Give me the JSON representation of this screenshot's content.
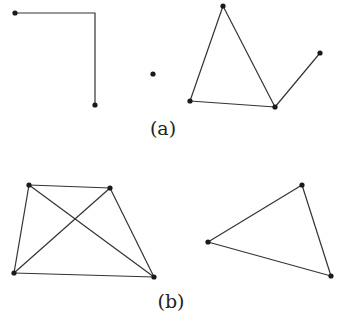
{
  "figure": {
    "width": 341,
    "height": 332,
    "colors": {
      "edge": "#333333",
      "vertex": "#1a1a1a",
      "label": "#222222",
      "background": "#ffffff"
    },
    "panels": [
      {
        "id": "a",
        "label": "(a)",
        "label_pos": [
          163,
          135
        ],
        "components": [
          {
            "name": "path-component",
            "vertices": [
              [
                15,
                13
              ],
              [
                95,
                105
              ]
            ],
            "bend_points": [
              [
                95,
                13
              ]
            ],
            "edges": [
              [
                [
                  15,
                  13
                ],
                [
                  95,
                  13
                ]
              ],
              [
                [
                  95,
                  13
                ],
                [
                  95,
                  105
                ]
              ]
            ]
          },
          {
            "name": "isolated-vertex",
            "vertices": [
              [
                153,
                74
              ]
            ],
            "edges": []
          },
          {
            "name": "triangle-with-pendant",
            "vertices": [
              [
                223,
                6
              ],
              [
                190,
                101
              ],
              [
                275,
                107
              ],
              [
                320,
                53
              ]
            ],
            "edges": [
              [
                0,
                1
              ],
              [
                0,
                2
              ],
              [
                1,
                2
              ],
              [
                2,
                3
              ]
            ]
          }
        ]
      },
      {
        "id": "b",
        "label": "(b)",
        "label_pos": [
          171,
          308
        ],
        "components": [
          {
            "name": "complete-graph-k4",
            "vertices": [
              [
                29,
                185
              ],
              [
                110,
                188
              ],
              [
                14,
                273
              ],
              [
                154,
                277
              ]
            ],
            "edges": [
              [
                0,
                1
              ],
              [
                0,
                2
              ],
              [
                0,
                3
              ],
              [
                1,
                2
              ],
              [
                1,
                3
              ],
              [
                2,
                3
              ]
            ]
          },
          {
            "name": "triangle",
            "vertices": [
              [
                302,
                185
              ],
              [
                208,
                242
              ],
              [
                331,
                276
              ]
            ],
            "edges": [
              [
                0,
                1
              ],
              [
                1,
                2
              ],
              [
                0,
                2
              ]
            ]
          }
        ]
      }
    ]
  }
}
